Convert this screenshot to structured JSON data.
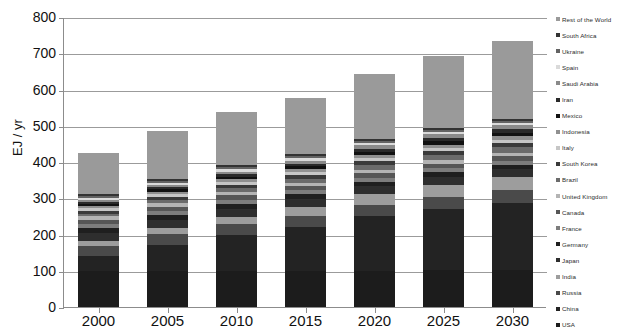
{
  "chart_data": {
    "type": "bar",
    "stacked": true,
    "title": "",
    "xlabel": "",
    "ylabel": "EJ / yr",
    "ylim": [
      0,
      800
    ],
    "yticks": [
      0,
      100,
      200,
      300,
      400,
      500,
      600,
      700,
      800
    ],
    "grid": true,
    "legend_position": "right",
    "categories": [
      "2000",
      "2005",
      "2010",
      "2015",
      "2020",
      "2025",
      "2030"
    ],
    "totals": [
      424,
      487,
      539,
      576,
      644,
      693,
      733
    ],
    "series": [
      {
        "name": "USA",
        "color": "#1c1c1c",
        "values": [
          98,
          100,
          98,
          98,
          100,
          101,
          102
        ]
      },
      {
        "name": "China",
        "color": "#232323",
        "values": [
          44,
          72,
          100,
          122,
          150,
          170,
          186
        ]
      },
      {
        "name": "Russia",
        "color": "#4a4a4a",
        "values": [
          27,
          29,
          30,
          31,
          32,
          33,
          34
        ]
      },
      {
        "name": "India",
        "color": "#9d9d9d",
        "values": [
          13,
          16,
          21,
          25,
          30,
          34,
          38
        ]
      },
      {
        "name": "Japan",
        "color": "#2e2e2e",
        "values": [
          22,
          22,
          22,
          21,
          21,
          21,
          20
        ]
      },
      {
        "name": "Germany",
        "color": "#1f1f1f",
        "values": [
          14,
          14,
          14,
          14,
          13,
          13,
          13
        ]
      },
      {
        "name": "France",
        "color": "#7d7d7d",
        "values": [
          11,
          11,
          11,
          11,
          11,
          11,
          11
        ]
      },
      {
        "name": "Canada",
        "color": "#565656",
        "values": [
          11,
          12,
          12,
          12,
          13,
          13,
          13
        ]
      },
      {
        "name": "United Kingdom",
        "color": "#b4b4b4",
        "values": [
          10,
          10,
          10,
          9,
          9,
          9,
          9
        ]
      },
      {
        "name": "Brazil",
        "color": "#6b6b6b",
        "values": [
          8,
          9,
          10,
          11,
          13,
          14,
          15
        ]
      },
      {
        "name": "South Korea",
        "color": "#3a3a3a",
        "values": [
          8,
          9,
          10,
          10,
          11,
          11,
          12
        ]
      },
      {
        "name": "Italy",
        "color": "#c6c6c6",
        "values": [
          8,
          8,
          8,
          8,
          8,
          8,
          8
        ]
      },
      {
        "name": "Indonesia",
        "color": "#909090",
        "values": [
          5,
          6,
          7,
          8,
          9,
          10,
          11
        ]
      },
      {
        "name": "Mexico",
        "color": "#121212",
        "values": [
          6,
          7,
          7,
          8,
          8,
          9,
          9
        ]
      },
      {
        "name": "Iran",
        "color": "#2a2a2a",
        "values": [
          5,
          6,
          7,
          8,
          9,
          10,
          10
        ]
      },
      {
        "name": "Saudi Arabia",
        "color": "#8a8a8a",
        "values": [
          5,
          6,
          7,
          8,
          9,
          10,
          10
        ]
      },
      {
        "name": "Spain",
        "color": "#dadada",
        "values": [
          5,
          6,
          6,
          6,
          6,
          6,
          6
        ]
      },
      {
        "name": "Ukraine",
        "color": "#636363",
        "values": [
          6,
          6,
          6,
          6,
          6,
          6,
          6
        ]
      },
      {
        "name": "South Africa",
        "color": "#333333",
        "values": [
          5,
          5,
          5,
          6,
          6,
          6,
          6
        ]
      },
      {
        "name": "Rest of the World",
        "color": "#9a9a9a",
        "values": [
          113,
          133,
          148,
          154,
          180,
          198,
          214
        ]
      }
    ]
  },
  "axis": {
    "y_title": "EJ / yr",
    "y_tick_labels": [
      "800",
      "700",
      "600",
      "500",
      "400",
      "300",
      "200",
      "100",
      "0"
    ],
    "x_tick_labels": [
      "2000",
      "2005",
      "2010",
      "2015",
      "2020",
      "2025",
      "2030"
    ]
  },
  "title_sliver": ""
}
